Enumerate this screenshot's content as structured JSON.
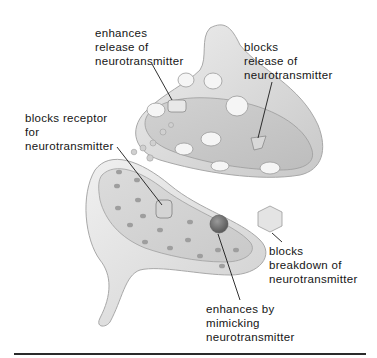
{
  "diagram": {
    "style": "grayscale illustration",
    "colors": {
      "background": "#ffffff",
      "text": "#151515",
      "membrane_light": "#e6e6e6",
      "membrane_mid": "#cfcfcf",
      "membrane_dark": "#b3b3b3",
      "pointer_line": "#1a1a1a",
      "bottom_rule": "#2a2a2a"
    },
    "structures": [
      {
        "id": "presynaptic-terminal",
        "name": "presynaptic axon terminal with vesicles"
      },
      {
        "id": "postsynaptic-dendrite",
        "name": "postsynaptic membrane with receptor sites"
      },
      {
        "id": "synaptic-cleft",
        "name": "synaptic cleft with neurotransmitter molecules"
      },
      {
        "id": "drug-cube",
        "name": "hexagonal drug molecule"
      },
      {
        "id": "mimic-sphere",
        "name": "spherical mimic molecule on receptor"
      },
      {
        "id": "receptor-block",
        "name": "cylindrical blocker in receptor"
      }
    ],
    "labels": [
      {
        "id": "enhances-release",
        "lines": [
          "enhances",
          "release of",
          "neurotransmitter"
        ]
      },
      {
        "id": "blocks-release",
        "lines": [
          "blocks",
          "release of",
          "neurotransmitter"
        ]
      },
      {
        "id": "blocks-receptor",
        "lines": [
          "blocks receptor",
          "for",
          "neurotransmitter"
        ]
      },
      {
        "id": "blocks-breakdown",
        "lines": [
          "blocks",
          "breakdown of",
          "neurotransmitter"
        ]
      },
      {
        "id": "enhances-mimicking",
        "lines": [
          "enhances by",
          "mimicking",
          "neurotransmitter"
        ]
      }
    ]
  }
}
